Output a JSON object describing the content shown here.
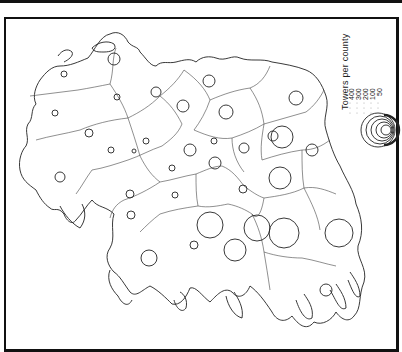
{
  "map": {
    "title": "Towers per county",
    "colors": {
      "ink": "#222222",
      "background": "#ffffff",
      "frame": "#111111"
    },
    "legend": {
      "title": "Towers per county",
      "values": [
        "400",
        "300",
        "200",
        "100",
        "50"
      ]
    },
    "counties_with_symbols": [
      {
        "cx": 64,
        "cy": 74,
        "r": 3
      },
      {
        "cx": 114,
        "cy": 59,
        "r": 6
      },
      {
        "cx": 156,
        "cy": 92,
        "r": 5
      },
      {
        "cx": 209,
        "cy": 81,
        "r": 6
      },
      {
        "cx": 117,
        "cy": 73,
        "r": 3
      },
      {
        "cx": 185,
        "cy": 106,
        "r": 6
      },
      {
        "cx": 226,
        "cy": 112,
        "r": 7
      },
      {
        "cx": 55,
        "cy": 113,
        "r": 3
      },
      {
        "cx": 89,
        "cy": 133,
        "r": 4
      },
      {
        "cx": 147,
        "cy": 116,
        "r": 3
      },
      {
        "cx": 111,
        "cy": 150,
        "r": 3
      },
      {
        "cx": 296,
        "cy": 120,
        "r": 7
      },
      {
        "cx": 273,
        "cy": 136,
        "r": 5
      },
      {
        "cx": 272,
        "cy": 176,
        "r": 11
      },
      {
        "cx": 245,
        "cy": 148,
        "r": 5
      },
      {
        "cx": 190,
        "cy": 150,
        "r": 6
      },
      {
        "cx": 214,
        "cy": 163,
        "r": 6
      },
      {
        "cx": 171,
        "cy": 168,
        "r": 3
      },
      {
        "cx": 144,
        "cy": 142,
        "r": 3
      },
      {
        "cx": 134,
        "cy": 151,
        "r": 2
      },
      {
        "cx": 60,
        "cy": 177,
        "r": 5
      },
      {
        "cx": 130,
        "cy": 194,
        "r": 4
      },
      {
        "cx": 174,
        "cy": 195,
        "r": 3
      },
      {
        "cx": 243,
        "cy": 189,
        "r": 4
      },
      {
        "cx": 250,
        "cy": 210,
        "r": 6
      },
      {
        "cx": 280,
        "cy": 178,
        "r": 11
      },
      {
        "cx": 210,
        "cy": 225,
        "r": 13
      },
      {
        "cx": 131,
        "cy": 215,
        "r": 4
      },
      {
        "cx": 148,
        "cy": 258,
        "r": 8
      },
      {
        "cx": 193,
        "cy": 245,
        "r": 4
      },
      {
        "cx": 284,
        "cy": 233,
        "r": 15
      },
      {
        "cx": 339,
        "cy": 233,
        "r": 14
      },
      {
        "cx": 235,
        "cy": 250,
        "r": 11
      },
      {
        "cx": 326,
        "cy": 290,
        "r": 6
      },
      {
        "cx": 188,
        "cy": 265,
        "r": 6
      }
    ]
  }
}
